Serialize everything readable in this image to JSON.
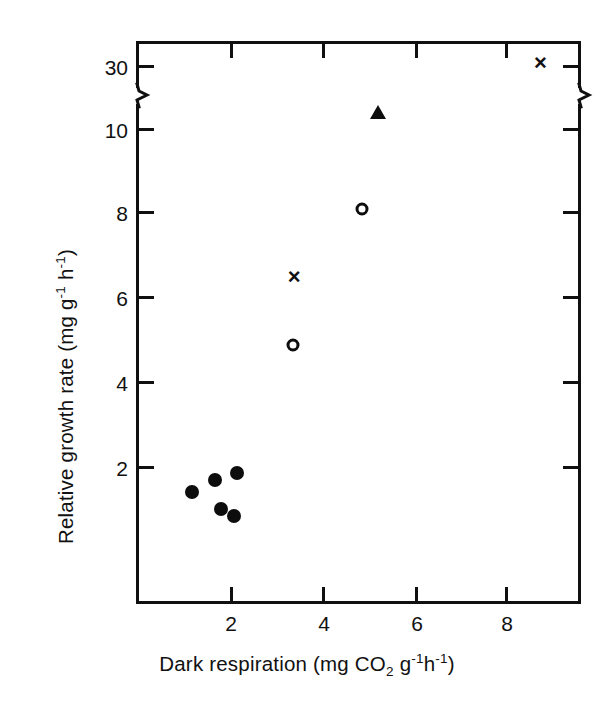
{
  "figure": {
    "background_color": "#ffffff",
    "ink_color": "#111111"
  },
  "chart_data": {
    "type": "scatter",
    "title": "",
    "xlabel": "Dark respiration (mg CO2 g-1 h-1)",
    "ylabel": "Relative growth rate (mg g-1 h-1)",
    "xlim": [
      0,
      9.6
    ],
    "ylim": [
      0,
      31.5
    ],
    "grid": false,
    "legend_position": "none",
    "y_axis_break": {
      "present": true,
      "below_break_max": 11,
      "above_break_min": 29,
      "note": "axis break between 10 and 30 on both left and right spines"
    },
    "x_ticks": [
      2,
      4,
      6,
      8
    ],
    "x_tick_labels": [
      "2",
      "4",
      "6",
      "8"
    ],
    "y_ticks": [
      2,
      4,
      6,
      8,
      10,
      30
    ],
    "y_tick_labels": [
      "2",
      "4",
      "6",
      "8",
      "10",
      "30"
    ],
    "series": [
      {
        "name": "filled-circle",
        "marker": "filled circle",
        "points": [
          {
            "x": 1.15,
            "y": 1.4
          },
          {
            "x": 1.65,
            "y": 1.7
          },
          {
            "x": 2.13,
            "y": 1.85
          },
          {
            "x": 1.78,
            "y": 1.0
          },
          {
            "x": 2.06,
            "y": 0.85
          }
        ]
      },
      {
        "name": "open-circle",
        "marker": "open circle",
        "points": [
          {
            "x": 3.35,
            "y": 4.9
          },
          {
            "x": 4.85,
            "y": 8.1
          }
        ]
      },
      {
        "name": "cross",
        "marker": "x",
        "points": [
          {
            "x": 3.38,
            "y": 6.55
          },
          {
            "x": 8.75,
            "y": 30.8
          }
        ]
      },
      {
        "name": "filled-triangle",
        "marker": "filled triangle",
        "points": [
          {
            "x": 5.2,
            "y": 10.4
          }
        ]
      }
    ]
  },
  "axes": {
    "y_title_parts": {
      "lead": "Relative growth rate (mg g",
      "sup1": "-1",
      "mid": " h",
      "sup2": "-1",
      "tail": ")"
    },
    "x_title_parts": {
      "lead": "Dark  respiration (mg CO",
      "sub1": "2",
      "mid": " g",
      "sup1": "-1",
      "mid2": "h",
      "sup2": "-1",
      "tail": ")"
    },
    "y_tick_labels": [
      "30",
      "10",
      "8",
      "6",
      "4",
      "2"
    ],
    "x_tick_labels": [
      "2",
      "4",
      "6",
      "8"
    ]
  },
  "markers": {
    "cross_glyph": "×"
  }
}
